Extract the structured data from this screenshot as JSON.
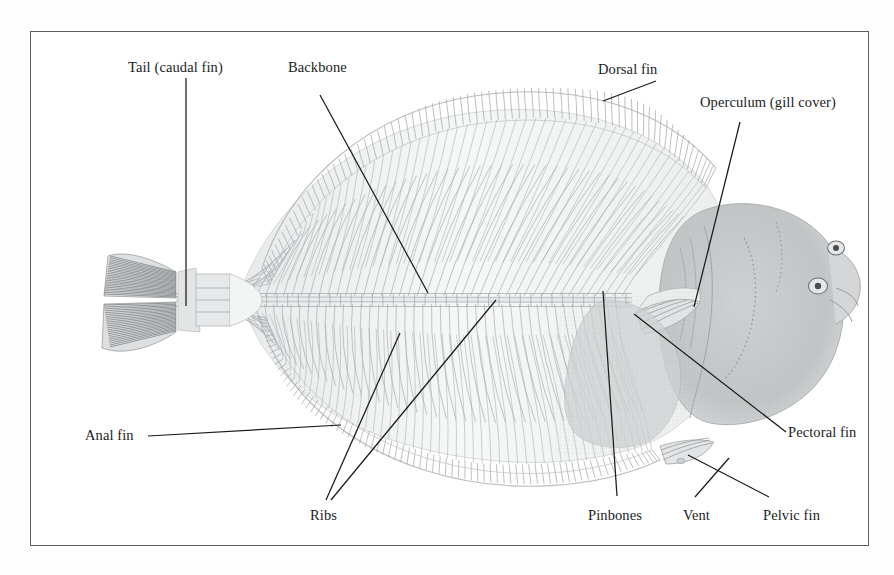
{
  "figure": {
    "frame": {
      "border_color": "#5d5d5d",
      "background": "#ffffff"
    },
    "ink_color": "#1c1c1c",
    "skeleton_tint": "#b9bcbe",
    "head_tint": "#c6c8c9"
  },
  "labels": [
    {
      "id": "tail",
      "text": "Tail (caudal fin)",
      "x": 128,
      "y": 60,
      "anchor": "start"
    },
    {
      "id": "backbone",
      "text": "Backbone",
      "x": 288,
      "y": 60,
      "anchor": "start"
    },
    {
      "id": "dorsal",
      "text": "Dorsal fin",
      "x": 598,
      "y": 62,
      "anchor": "start"
    },
    {
      "id": "operculum",
      "text": "Operculum (gill cover)",
      "x": 700,
      "y": 95,
      "anchor": "start"
    },
    {
      "id": "pectoral",
      "text": "Pectoral fin",
      "x": 788,
      "y": 425,
      "anchor": "start"
    },
    {
      "id": "pelvic",
      "text": "Pelvic fin",
      "x": 763,
      "y": 508,
      "anchor": "start"
    },
    {
      "id": "vent",
      "text": "Vent",
      "x": 683,
      "y": 508,
      "anchor": "start"
    },
    {
      "id": "pinbones",
      "text": "Pinbones",
      "x": 588,
      "y": 508,
      "anchor": "start"
    },
    {
      "id": "ribs",
      "text": "Ribs",
      "x": 310,
      "y": 508,
      "anchor": "start"
    },
    {
      "id": "anal",
      "text": "Anal fin",
      "x": 85,
      "y": 428,
      "anchor": "start"
    }
  ],
  "leader_lines": [
    {
      "id": "tail-leader",
      "points": "186,78 186,306"
    },
    {
      "id": "backbone-leader",
      "points": "320,95 428,293"
    },
    {
      "id": "dorsal-leader",
      "points": "656,81 603,101"
    },
    {
      "id": "operculum-leader",
      "points": "740,122 694,307"
    },
    {
      "id": "pectoral-leader",
      "points": "786,432 634,314"
    },
    {
      "id": "pelvic-leader",
      "points": "769,497 688,455"
    },
    {
      "id": "vent-leader",
      "points": "695,497 729,458"
    },
    {
      "id": "pinbones-leader",
      "points": "617,496 603,291"
    },
    {
      "id": "ribs-leader-a",
      "points": "326,500 400,333"
    },
    {
      "id": "ribs-leader-b",
      "points": "331,500 496,300"
    },
    {
      "id": "anal-leader",
      "points": "148,436 341,425"
    }
  ],
  "anatomy_parts": [
    "Tail (caudal fin)",
    "Backbone",
    "Dorsal fin",
    "Operculum (gill cover)",
    "Pectoral fin",
    "Pelvic fin",
    "Vent",
    "Pinbones",
    "Ribs",
    "Anal fin"
  ]
}
